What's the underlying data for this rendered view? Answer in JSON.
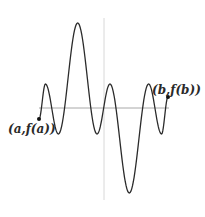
{
  "diagram": {
    "labels": {
      "left_endpoint": "(a,f(a))",
      "right_endpoint": "(b,f(b))"
    },
    "colors": {
      "curve": "#2b2b2b",
      "axis": "#a8a8a8",
      "vertical_line": "#d8d8d8",
      "point": "#111111"
    },
    "curve_points": [
      [
        0.0,
        -0.22
      ],
      [
        0.05,
        0.48
      ],
      [
        0.15,
        -0.52
      ],
      [
        0.3,
        1.7
      ],
      [
        0.45,
        -0.52
      ],
      [
        0.55,
        0.48
      ],
      [
        0.7,
        -1.7
      ],
      [
        0.85,
        0.48
      ],
      [
        0.95,
        -0.52
      ],
      [
        1.0,
        0.22
      ]
    ]
  }
}
